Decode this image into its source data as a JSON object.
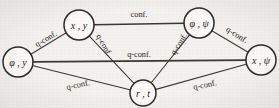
{
  "figure": {
    "kind": "graph-diagram",
    "background_color": "#f4f2ef",
    "ink_color": "#2b2826",
    "width": 279,
    "height": 108
  },
  "nodes": [
    {
      "id": "phi_y",
      "label": "φ , y",
      "cx": 18,
      "cy": 62,
      "r": 15
    },
    {
      "id": "x_y",
      "label": "x , y",
      "cx": 79,
      "cy": 25,
      "r": 15
    },
    {
      "id": "phi_psi",
      "label": "φ , ψ",
      "cx": 199,
      "cy": 23,
      "r": 15
    },
    {
      "id": "x_psi",
      "label": "x , ψ",
      "cx": 261,
      "cy": 60,
      "r": 15
    },
    {
      "id": "r_t",
      "label": "r , t",
      "cx": 143,
      "cy": 93,
      "r": 13
    }
  ],
  "edges": [
    {
      "id": "e-xy-phipsi",
      "from": "x_y",
      "to": "phi_psi",
      "label": "conf.",
      "label_x": 139,
      "label_y": 14,
      "label_rotate": 0,
      "thick": true
    },
    {
      "id": "e-phiy-xy",
      "from": "phi_y",
      "to": "x_y",
      "label": "q-conf.",
      "label_x": 46,
      "label_y": 39,
      "label_rotate": -31,
      "thick": false
    },
    {
      "id": "e-phiy-xpsi",
      "from": "phi_y",
      "to": "x_psi",
      "label": "q-conf.",
      "label_x": 139,
      "label_y": 54,
      "label_rotate": 0,
      "thick": true
    },
    {
      "id": "e-phiy-rt",
      "from": "phi_y",
      "to": "r_t",
      "label": "q-conf.",
      "label_x": 78,
      "label_y": 85,
      "label_rotate": -12,
      "thick": false
    },
    {
      "id": "e-xy-rt",
      "from": "x_y",
      "to": "r_t",
      "label": "q-conf.",
      "label_x": 104,
      "label_y": 45,
      "label_rotate": 60,
      "thick": false
    },
    {
      "id": "e-phipsi-rt",
      "from": "phi_psi",
      "to": "r_t",
      "label": "q-conf.",
      "label_x": 179,
      "label_y": 44,
      "label_rotate": -58,
      "thick": false
    },
    {
      "id": "e-phipsi-xpsi",
      "from": "phi_psi",
      "to": "x_psi",
      "label": "q-conf.",
      "label_x": 237,
      "label_y": 35,
      "label_rotate": 32,
      "thick": false
    },
    {
      "id": "e-rt-xpsi",
      "from": "r_t",
      "to": "x_psi",
      "label": "q-conf.",
      "label_x": 205,
      "label_y": 85,
      "label_rotate": -11,
      "thick": false
    }
  ],
  "labels": {
    "conf": "conf.",
    "q_conf": "q-conf."
  }
}
